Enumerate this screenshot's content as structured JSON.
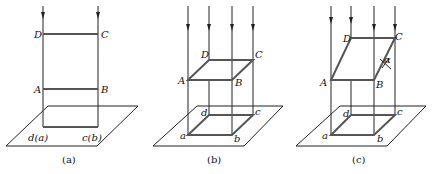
{
  "figure": {
    "panels": [
      {
        "id": "a",
        "caption": "(a)",
        "labels": {
          "D": "D",
          "C": "C",
          "A": "A",
          "B": "B",
          "da": "d(a)",
          "cb": "c(b)"
        }
      },
      {
        "id": "b",
        "caption": "(b)",
        "labels": {
          "D": "D",
          "C": "C",
          "A": "A",
          "B": "B",
          "a": "a",
          "b": "b",
          "c": "c",
          "d": "d"
        }
      },
      {
        "id": "c",
        "caption": "(c)",
        "labels": {
          "D": "D",
          "C": "C",
          "A": "A",
          "B": "B",
          "a": "a",
          "b": "b",
          "c": "c",
          "d": "d",
          "angle": "α"
        }
      }
    ],
    "colors": {
      "line": "#222222",
      "edge": "#555555",
      "background": "#ffffff"
    }
  }
}
